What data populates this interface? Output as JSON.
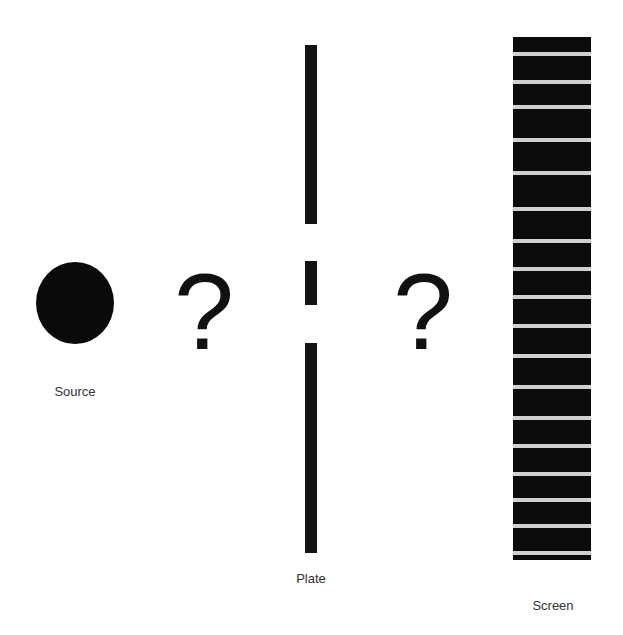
{
  "diagram": {
    "title": "",
    "labels": {
      "source": "Source",
      "plate": "Plate",
      "screen": "Screen"
    },
    "unknowns": {
      "before_plate": "?",
      "after_plate": "?"
    },
    "colors": {
      "background": "#ffffff",
      "objects": "#0b0b0b",
      "screen_fringe": "#cfcfcf"
    },
    "plate": {
      "segments": [
        {
          "top": 45,
          "bottom": 224
        },
        {
          "top": 261,
          "bottom": 305
        },
        {
          "top": 343,
          "bottom": 553
        }
      ],
      "slits": 2
    },
    "screen": {
      "fringe_count": 18,
      "fringe_y": [
        54,
        82,
        107,
        140,
        173,
        209,
        241,
        269,
        297,
        326,
        356,
        387,
        418,
        446,
        474,
        500,
        526,
        553
      ]
    }
  }
}
